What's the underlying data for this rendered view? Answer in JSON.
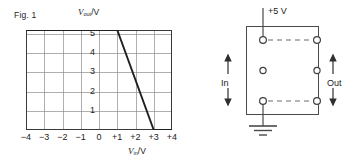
{
  "figure": {
    "caption": "Fig. 1"
  },
  "chart_data": {
    "type": "line",
    "title": "Fig. 1",
    "xlabel": "Vin/V",
    "ylabel": "Vout/V",
    "xlabel_var": "V",
    "xlabel_sub": "in",
    "xlabel_unit": "/V",
    "ylabel_var": "V",
    "ylabel_sub": "out",
    "ylabel_unit": "/V",
    "xlim": [
      -4,
      4
    ],
    "ylim": [
      0,
      5.2
    ],
    "xticks": [
      "−4",
      "−3",
      "−2",
      "−1",
      "0",
      "+1",
      "+2",
      "+3",
      "+4"
    ],
    "xtick_values": [
      -4,
      -3,
      -2,
      -1,
      0,
      1,
      2,
      3,
      4
    ],
    "yticks": [
      "1",
      "2",
      "3",
      "4",
      "5"
    ],
    "ytick_values": [
      1,
      2,
      3,
      4,
      5
    ],
    "grid": true,
    "legend": "none",
    "series": [
      {
        "name": "transfer characteristic",
        "x": [
          -4,
          1,
          3,
          4
        ],
        "y": [
          5.2,
          5.2,
          0,
          0
        ]
      }
    ],
    "annotations": [
      "flat output 5.2 V for Vin from -4 V to +1 V",
      "linear fall from 5.2 V at +1 V to 0 V at +3 V"
    ]
  },
  "circuit": {
    "supply_label": "+5 V",
    "input_label": "In",
    "output_label": "Out",
    "ground_label": "ground",
    "package_name": "ic-package",
    "pins_left": 3,
    "pins_right": 3,
    "dashed_links": 2
  }
}
